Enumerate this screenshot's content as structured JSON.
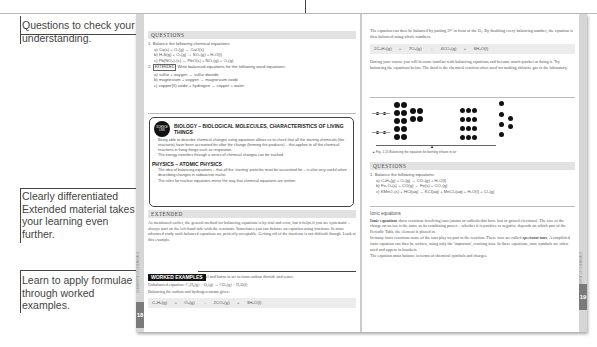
{
  "callouts": [
    {
      "text": "Questions to check your understanding."
    },
    {
      "text": "Clearly differentiated Extended material takes your learning even further."
    },
    {
      "text": "Learn to apply formulae through worked examples."
    }
  ],
  "left_page": {
    "page_number": "18",
    "side_label": "CHEMISTRY OF CHEMICALS",
    "questions": {
      "heading": "QUESTIONS",
      "q1": "1. Balance the following chemical equations:",
      "q1_items": [
        "a) Ca(s) + O₂(g) → CaO(s)",
        "b) H₂S(g) + O₂(g) → SO₂(g) + H₂O(l)",
        "c) Pb(NO₃)₂(s) → PbO(s) + NO₂(g) + O₂(g)"
      ],
      "q2_num": "2.",
      "q2_tag": "EXTENDED",
      "q2": "Write balanced equations for the following word equations:",
      "q2_items": [
        "a) sulfur + oxygen → sulfur dioxide",
        "b) magnesium + oxygen → magnesium oxide",
        "c) copper(II) oxide + hydrogen → copper + water"
      ]
    },
    "science_link": {
      "badge": "SCIENCE LINK",
      "biology_heading": "BIOLOGY – BIOLOGICAL MOLECULES, CHARACTERISTICS OF LIVING THINGS",
      "biology_bullets": [
        "Being able to describe chemical changes using equations allows us to check that all the starting chemicals (the reactants) have been accounted for after the change (forming the products) – this applies to all the chemical reactions in living things such as respiration.",
        "The energy transfers through a series of chemical changes can be tracked."
      ],
      "physics_heading": "PHYSICS – ATOMIC PHYSICS",
      "physics_bullets": [
        "The idea of balancing equations – that all the 'starting' particles must be accounted for – is also very useful when describing changes in radioactive nuclei.",
        "The rules for nuclear equations mirror the way that chemical equations are written."
      ]
    },
    "extended": {
      "heading": "EXTENDED",
      "text": "As mentioned earlier, the general method for balancing equations is by trial and error, but it helps if you are systematic – always start on the left-hand side with the reactants. Sometimes you can balance an equation using fractions. In more advanced study such balanced equations are perfectly acceptable. Getting rid of the fractions is not difficult though. Look at this example."
    },
    "worked_examples": {
      "heading": "WORKED EXAMPLES",
      "p1": "Ethane (C₂H₆) is a hydrocarbon fuel and burns in air to form carbon dioxide and water.",
      "p2": "Unbalanced equation: C₂H₆(g) + O₂(g) → CO₂(g) + H₂O(l)",
      "p3": "Balancing the carbon and hydrogen atoms gives:",
      "equation": [
        "C₂H₆(g)",
        "+",
        "O₂(g)",
        "→",
        "2CO₂(g)",
        "+",
        "3H₂O(l)"
      ]
    }
  },
  "right_page": {
    "page_number": "19",
    "side_label": "CHEMISTRY OF CHEMICALS",
    "intro": "The equation can then be balanced by putting 3½ in front of the O₂. By doubling every balancing number, the equation is then balanced using whole numbers.",
    "equation": [
      "2C₂H₆(g)",
      "+",
      "7O₂(g)",
      "→",
      "4CO₂(g)",
      "+",
      "6H₂O(l)"
    ],
    "para": "During your course you will become familiar with balancing equations and become much quicker at doing it. Try balancing the equations below. The third is the chemical reaction often used for making chlorine gas in the laboratory.",
    "figure_caption": "▲ Fig. 1.15 Balancing the equation for burning ethane in air",
    "questions": {
      "heading": "QUESTIONS",
      "q1": "1. Balance the following equations:",
      "items": [
        "a) C₃H₈(g) + O₂(g) → CO₂(g) + H₂O(l)",
        "b) Fe₂O₃(s) + CO(g) → Fe(s) + CO₂(g)",
        "c) KMnO₄(s) + HCl(aq) → KCl(aq) + MnCl₂(aq) + H₂O(l) + Cl₂(g)"
      ]
    },
    "ionic": {
      "heading": "Ionic equations",
      "p1_bold": "Ionic equations",
      "p1": " show reactions involving ions (atoms or radicals that have lost or gained electrons). The size of the charge on an ion is the same as its combining power – whether it is positive or negative depends on which part of the Periodic Table the element is placed in.",
      "p2a": "In many ionic reactions some of the ions play no part in the reaction. These ions are called ",
      "p2_bold": "spectator ions",
      "p2b": ". A simplified ionic equation can then be written, using only the 'important', reacting ions. In these equations, state symbols are often used and appear in brackets.",
      "p3": "The equation must balance in terms of chemical symbols and charges."
    }
  },
  "colors": {
    "accent_dark": "#111111",
    "header_bar": "#e2e2e2",
    "tab_gray": "#7a7a7a"
  }
}
